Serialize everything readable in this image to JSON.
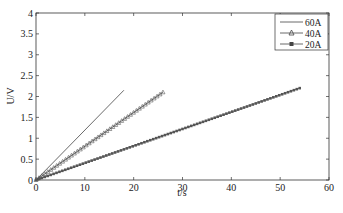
{
  "chart_data": {
    "type": "line",
    "title": "",
    "xlabel": "t/s",
    "ylabel": "U/V",
    "xlim": [
      0,
      60
    ],
    "ylim": [
      0,
      4
    ],
    "xticks": [
      0,
      10,
      20,
      30,
      40,
      50,
      60
    ],
    "yticks": [
      0,
      0.5,
      1,
      1.5,
      2,
      2.5,
      3,
      3.5,
      4
    ],
    "ytick_labels": [
      "0",
      "0.5",
      "1",
      "1.5",
      "2",
      "2.5",
      "3",
      "3.5",
      "4"
    ],
    "grid": false,
    "legend_position": "upper right",
    "series": [
      {
        "name": "60A",
        "marker": "none",
        "x": [
          0,
          18
        ],
        "y": [
          0,
          2.15
        ]
      },
      {
        "name": "40A",
        "marker": "triangle",
        "x": [
          0,
          26
        ],
        "y": [
          0,
          2.1
        ]
      },
      {
        "name": "20A",
        "marker": "star",
        "x": [
          0,
          54
        ],
        "y": [
          0,
          2.2
        ]
      }
    ]
  },
  "legend": {
    "items": [
      {
        "label": "60A"
      },
      {
        "label": "40A"
      },
      {
        "label": "20A"
      }
    ]
  },
  "colors": {
    "axis": "#333333",
    "line": "#444444"
  }
}
